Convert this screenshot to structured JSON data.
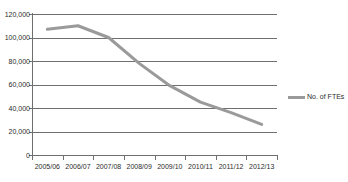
{
  "chart_data": {
    "type": "line",
    "title": "",
    "xlabel": "",
    "ylabel": "",
    "categories": [
      "2005/06",
      "2006/07",
      "2007/08",
      "2008/09",
      "2009/10",
      "2010/11",
      "2011/12",
      "2012/13"
    ],
    "series": [
      {
        "name": "No. of FTEs",
        "color": "#9a9a9a",
        "values": [
          107000,
          110000,
          100000,
          78000,
          59000,
          45000,
          36000,
          26000
        ]
      }
    ],
    "ylim": [
      0,
      120000
    ],
    "ytick_labels": [
      "120,000",
      "100,000",
      "80,000",
      "60,000",
      "40,000",
      "20,000",
      "0"
    ],
    "ytick_values": [
      120000,
      100000,
      80000,
      60000,
      40000,
      20000,
      0
    ],
    "grid": true,
    "grid_axis": "y",
    "legend_position": "right",
    "legend": [
      "No. of FTEs"
    ]
  },
  "legend": {
    "label": "No. of FTEs",
    "swatch_color": "#9a9a9a"
  },
  "title_remnant": "",
  "axes": {
    "line_color": "#6f6f6f"
  }
}
